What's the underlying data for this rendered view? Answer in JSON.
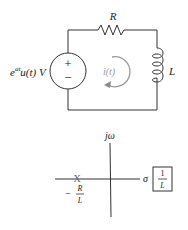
{
  "circuit": {
    "source_label": {
      "base": "e",
      "exp": "at",
      "rest": "u(t) V"
    },
    "source_polarity": {
      "plus": "+",
      "minus": "−"
    },
    "resistor_label": "R",
    "inductor_label": "L",
    "current_label": "i(t)",
    "colors": {
      "wire": "#333333",
      "current": "#9a9a9a"
    }
  },
  "pole_zero": {
    "vertical_axis_label": "jω",
    "horizontal_axis_label": "σ",
    "pole_marker": "X",
    "pole_label": {
      "sign": "−",
      "num": "R",
      "den": "L"
    },
    "gain_box": {
      "num": "1",
      "den": "L"
    },
    "colors": {
      "axis": "#333333",
      "pole": "#666666"
    }
  }
}
